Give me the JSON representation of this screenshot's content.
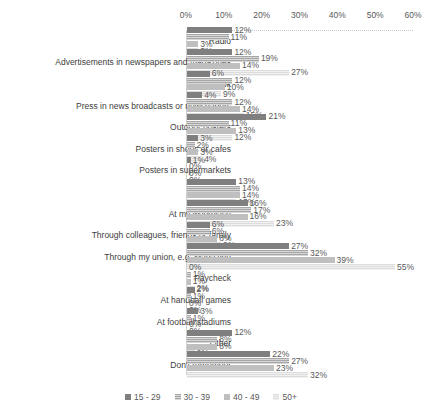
{
  "chart_data": {
    "type": "bar",
    "orientation": "horizontal",
    "title": "",
    "xlabel": "",
    "ylabel": "",
    "xlim": [
      0,
      60
    ],
    "grid": false,
    "legend_position": "bottom",
    "tick_labels": [
      "0%",
      "10%",
      "20%",
      "30%",
      "40%",
      "50%",
      "60%"
    ],
    "tick_values": [
      0,
      10,
      20,
      30,
      40,
      50,
      60
    ],
    "categories": [
      "Radio",
      "Advertisements in newspapers and magazines",
      "Facebook",
      "Press in news broadcasts or newspapers",
      "Outdoor posters",
      "Posters in shops or cafes",
      "Posters in supermarkets",
      "Websites",
      "At my workplace",
      "Through colleagues, friends or family",
      "Through my union, e.g. Magazine",
      "Paycheck",
      "At handball games",
      "At football stadiums",
      "Other",
      "Don't remember"
    ],
    "series": [
      {
        "name": "15 - 29",
        "values": [
          12,
          12,
          6,
          4,
          21,
          3,
          1,
          13,
          16,
          6,
          27,
          0,
          2,
          3,
          12,
          22
        ],
        "labels": [
          "12%",
          "12%",
          "6%",
          "4%",
          "21%",
          "3%",
          "1%",
          "13%",
          "16%",
          "6%",
          "27%",
          "0%",
          "2%",
          "3%",
          "12%",
          "22%"
        ]
      },
      {
        "name": "30 - 39",
        "values": [
          11,
          19,
          12,
          12,
          11,
          2,
          0,
          14,
          17,
          6,
          32,
          1,
          1,
          1,
          8,
          27
        ],
        "labels": [
          "11%",
          "19%",
          "12%",
          "12%",
          "11%",
          "2%",
          "0%",
          "14%",
          "17%",
          "6%",
          "32%",
          "1%",
          "1%",
          "1%",
          "8%",
          "27%"
        ]
      },
      {
        "name": "40 - 49",
        "values": [
          3,
          14,
          10,
          14,
          13,
          3,
          0,
          14,
          16,
          8,
          39,
          1,
          0,
          0,
          8,
          23
        ],
        "labels": [
          "3%",
          "14%",
          "10%",
          "14%",
          "13%",
          "3%",
          "0%",
          "14%",
          "16%",
          "8%",
          "39%",
          "1%",
          "0%",
          "0%",
          "8%",
          "23%"
        ]
      },
      {
        "name": "50+",
        "values": [
          3,
          27,
          9,
          15,
          12,
          4,
          0,
          13,
          23,
          9,
          55,
          2,
          0,
          0,
          2,
          32
        ],
        "labels": [
          "3%",
          "27%",
          "9%",
          "15%",
          "12%",
          "4%",
          "0%",
          "13%",
          "23%",
          "9%",
          "55%",
          "2%",
          "0%",
          "0%",
          "2%",
          "32%"
        ]
      }
    ]
  },
  "legend": {
    "items": [
      "15 - 29",
      "30 - 39",
      "40 - 49",
      "50+"
    ]
  }
}
